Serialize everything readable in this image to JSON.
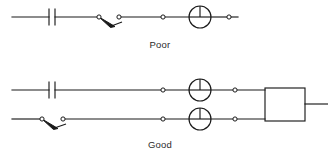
{
  "figure": {
    "background_color": "#ffffff",
    "line_color": "#1a1a1a",
    "width": 328,
    "height": 157
  },
  "circuits": [
    {
      "id": "poor",
      "caption": "Poor",
      "caption_x": 160,
      "caption_y": 48,
      "description": "Single-wire loop with capacitor, open knife switch, terminals and meter in series",
      "rows": [
        {
          "id": "poor-main-line",
          "y": 17,
          "x_start": 12,
          "x_end": 238
        }
      ],
      "components": [
        {
          "type": "capacitor",
          "name": "capacitor",
          "x": 52,
          "y": 17,
          "plate_gap": 6,
          "plate_height": 17
        },
        {
          "type": "knife-switch",
          "name": "knife-switch",
          "x_pivot": 99,
          "x_contact": 119,
          "y": 17,
          "state": "open"
        },
        {
          "type": "terminal",
          "name": "terminal",
          "x": 99,
          "y": 17
        },
        {
          "type": "terminal",
          "name": "terminal",
          "x": 119,
          "y": 17
        },
        {
          "type": "terminal",
          "name": "terminal",
          "x": 163,
          "y": 17
        },
        {
          "type": "meter",
          "name": "meter",
          "cx": 200,
          "cy": 17,
          "r": 11
        },
        {
          "type": "terminal",
          "name": "terminal",
          "x": 229,
          "y": 17
        }
      ]
    },
    {
      "id": "good",
      "caption": "Good",
      "caption_x": 160,
      "caption_y": 148,
      "description": "Two parallel wires, each with a meter, feeding an instrument box labeled A",
      "rows": [
        {
          "id": "good-upper-line",
          "y": 90,
          "x_start": 12,
          "x_end": 265
        },
        {
          "id": "good-lower-line",
          "y": 119,
          "x_start": 12,
          "x_end": 265
        }
      ],
      "components": [
        {
          "type": "capacitor",
          "name": "capacitor",
          "x": 52,
          "y": 90,
          "plate_gap": 6,
          "plate_height": 17
        },
        {
          "type": "knife-switch",
          "name": "knife-switch",
          "x_pivot": 42,
          "x_contact": 63,
          "y": 119,
          "state": "open"
        },
        {
          "type": "terminal",
          "name": "terminal",
          "x": 42,
          "y": 119
        },
        {
          "type": "terminal",
          "name": "terminal",
          "x": 63,
          "y": 119
        },
        {
          "type": "terminal",
          "name": "terminal",
          "x": 163,
          "y": 90
        },
        {
          "type": "terminal",
          "name": "terminal",
          "x": 163,
          "y": 119
        },
        {
          "type": "meter",
          "name": "meter",
          "cx": 200,
          "cy": 90,
          "r": 11
        },
        {
          "type": "meter",
          "name": "meter",
          "cx": 200,
          "cy": 119,
          "r": 11
        },
        {
          "type": "terminal",
          "name": "terminal",
          "x": 235,
          "y": 90
        },
        {
          "type": "terminal",
          "name": "terminal",
          "x": 235,
          "y": 119
        },
        {
          "type": "instrument-box",
          "name": "instrument-box",
          "x": 265,
          "y": 88,
          "width": 40,
          "height": 33,
          "label": "A",
          "lead_x_end": 328,
          "lead_y": 104
        }
      ]
    }
  ]
}
